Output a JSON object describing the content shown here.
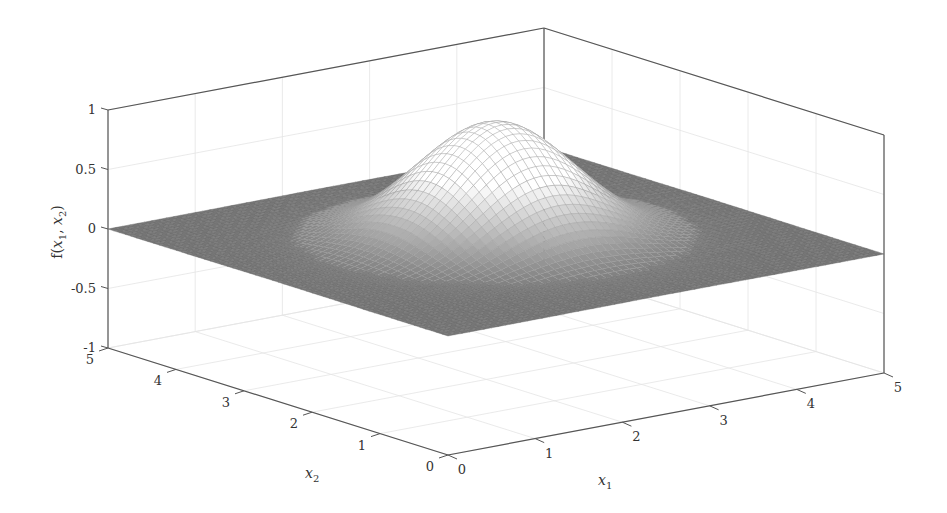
{
  "chart_data": {
    "type": "surface3d",
    "title": "",
    "function": "Gaussian bump centered at (2.5, 2.5), peak ≈ 1, background 0",
    "xlabel": "x_1",
    "ylabel": "x_2",
    "zlabel": "f(x_1, x_2)",
    "xlim": [
      0,
      5
    ],
    "ylim": [
      0,
      5
    ],
    "zlim": [
      -1,
      1
    ],
    "x_ticks": [
      "0",
      "1",
      "2",
      "3",
      "4",
      "5"
    ],
    "y_ticks": [
      "0",
      "1",
      "2",
      "3",
      "4",
      "5"
    ],
    "z_ticks": [
      "-1",
      "-0.5",
      "0",
      "0.5",
      "1"
    ],
    "peak": {
      "x1": 2.5,
      "x2": 2.5,
      "z": 1.0
    },
    "grid": true,
    "box": true,
    "colormap": "gray mesh on white",
    "colors": {
      "mesh": "#6e6e6e",
      "axes": "#555555",
      "grid": "#e4e4e4",
      "background": "#ffffff"
    }
  },
  "labels": {
    "x_axis": "x",
    "x_sub": "1",
    "y_axis": "x",
    "y_sub": "2",
    "z_axis_prefix": "f(",
    "z_axis_x1": "x",
    "z_axis_x1_sub": "1",
    "z_axis_sep": ", ",
    "z_axis_x2": "x",
    "z_axis_x2_sub": "2",
    "z_axis_suffix": ")"
  }
}
